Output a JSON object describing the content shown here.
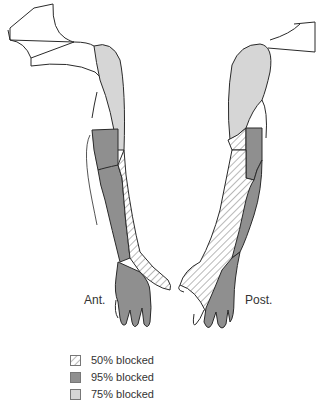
{
  "diagram": {
    "views": [
      {
        "id": "anterior",
        "label": "Ant."
      },
      {
        "id": "posterior",
        "label": "Post."
      }
    ]
  },
  "legend": {
    "items": [
      {
        "pattern": "hatched",
        "label": "50% blocked",
        "color": "#ffffff"
      },
      {
        "pattern": "dark",
        "label": "95% blocked",
        "color": "#8f8f8f"
      },
      {
        "pattern": "light",
        "label": "75% blocked",
        "color": "#d6d6d6"
      }
    ]
  },
  "colors": {
    "outline": "#2a2a2a",
    "dark_fill": "#8f8f8f",
    "light_fill": "#d6d6d6",
    "hatch": "#9a9a9a"
  }
}
